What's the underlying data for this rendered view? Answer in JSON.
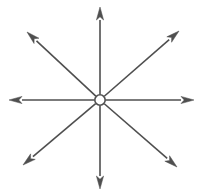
{
  "figure": {
    "background_color": "#ffffff",
    "stroke_color": "#4f4f4f",
    "arrow_fill_color": "#4f4f4f",
    "center_fill_color": "#ffffff",
    "stroke_width": 1.6,
    "arrowhead_length": 13,
    "arrowhead_half_width": 3.6,
    "canvas": {
      "width": 201,
      "height": 195
    },
    "center": {
      "label": "origin",
      "x": 100,
      "y": 100,
      "radius": 5.2
    },
    "rays": [
      {
        "name": "ray-north",
        "direction": "north",
        "angle_deg": 90,
        "tip_x": 100,
        "tip_y": 7,
        "length": 93
      },
      {
        "name": "ray-northeast",
        "direction": "northeast",
        "angle_deg": 45,
        "tip_x": 179,
        "tip_y": 31,
        "length": 106
      },
      {
        "name": "ray-east",
        "direction": "east",
        "angle_deg": 0,
        "tip_x": 194,
        "tip_y": 100,
        "length": 94
      },
      {
        "name": "ray-southeast",
        "direction": "southeast",
        "angle_deg": -45,
        "tip_x": 177,
        "tip_y": 167,
        "length": 103
      },
      {
        "name": "ray-south",
        "direction": "south",
        "angle_deg": -90,
        "tip_x": 100,
        "tip_y": 189,
        "length": 89
      },
      {
        "name": "ray-southwest",
        "direction": "southwest",
        "angle_deg": -135,
        "tip_x": 23,
        "tip_y": 165,
        "length": 104
      },
      {
        "name": "ray-west",
        "direction": "west",
        "angle_deg": 180,
        "tip_x": 9,
        "tip_y": 100,
        "length": 91
      },
      {
        "name": "ray-northwest",
        "direction": "northwest",
        "angle_deg": 135,
        "tip_x": 27,
        "tip_y": 32,
        "length": 104
      }
    ]
  }
}
